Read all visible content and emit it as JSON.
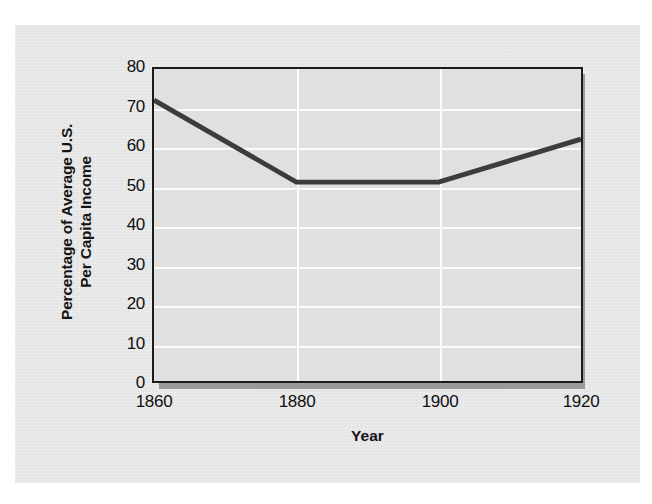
{
  "figure": {
    "panel_background": "#e8e8e8",
    "page_background": "#ffffff"
  },
  "chart_data": {
    "type": "line",
    "title": "",
    "subtitle": "",
    "xlabel": "Year",
    "ylabel": "Percentage of Average U.S. Per Capita Income",
    "ylabel_line1": "Percentage of Average U.S.",
    "ylabel_line2": "Per Capita Income",
    "x": [
      1860,
      1880,
      1900,
      1920
    ],
    "values": [
      72,
      51,
      51,
      62
    ],
    "categories": [
      "1860",
      "1880",
      "1900",
      "1920"
    ],
    "xticks": [
      "1860",
      "1880",
      "1900",
      "1920"
    ],
    "yticks": [
      "0",
      "10",
      "20",
      "30",
      "40",
      "50",
      "60",
      "70",
      "80"
    ],
    "ytick_values": [
      0,
      10,
      20,
      30,
      40,
      50,
      60,
      70,
      80
    ],
    "xlim": [
      1860,
      1920
    ],
    "ylim": [
      0,
      80
    ],
    "grid": "horizontal-and-vertical",
    "grid_color": "#fbfbfb",
    "legend": "none",
    "series": [
      {
        "name": "Percentage of Average U.S. Per Capita Income",
        "values": [
          72,
          51,
          51,
          62
        ],
        "color": "#3c3c3c",
        "line_width": 5
      }
    ],
    "annotations": []
  },
  "plot": {
    "frame_color": "#1b1b1b",
    "plot_background": "#e0e0e0",
    "shadow_color": "#9a9a9a",
    "line_color": "#3c3c3c"
  }
}
